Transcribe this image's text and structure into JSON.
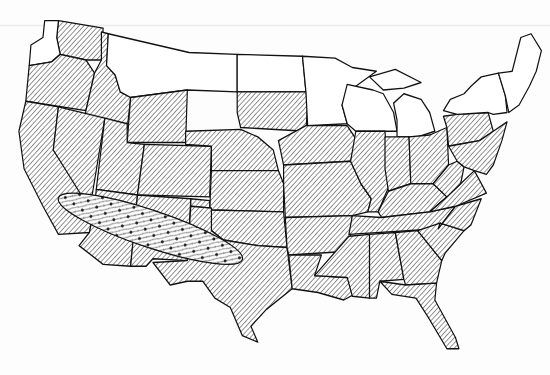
{
  "map": {
    "type": "choropleth-range-map",
    "region": "Contiguous United States",
    "colors": {
      "ink": "#111111",
      "paper": "#ffffff",
      "hatch": "#555555"
    },
    "legend": [],
    "patterns": {
      "hatched": "diagonal-hatch",
      "plain": "unshaded",
      "band": "stippled-dots-over-hatch"
    },
    "states": [
      {
        "id": "WA",
        "shade": "hatched",
        "d": "M68,22 L120,30 L118,64 L100,64 L70,58 L66,40 Z"
      },
      {
        "id": "WA-coast",
        "shade": "plain",
        "d": "M52,22 L68,22 L66,40 L70,58 L60,66 L34,70 L36,48 L50,40 Z"
      },
      {
        "id": "OR",
        "shade": "hatched",
        "d": "M34,70 L60,66 L70,58 L100,64 L110,78 L100,118 L30,108 Z"
      },
      {
        "id": "ID",
        "shade": "hatched",
        "d": "M118,34 L126,36 L124,70 L134,80 L140,98 L152,104 L148,138 L98,128 L100,118 L110,78 L118,64 Z"
      },
      {
        "id": "MT",
        "shade": "plain",
        "d": "M126,36 L220,56 L276,58 L276,98 L218,96 L152,104 L140,98 L134,80 L124,70 Z"
      },
      {
        "id": "ND",
        "shade": "plain",
        "d": "M276,58 L352,60 L356,98 L276,98 Z"
      },
      {
        "id": "SD",
        "shade": "hatched",
        "d": "M276,98 L356,98 L358,110 L356,140 L280,136 L276,120 Z"
      },
      {
        "id": "WY",
        "shade": "hatched",
        "d": "M152,104 L218,96 L216,152 L148,152 Z"
      },
      {
        "id": "CA",
        "shade": "hatched",
        "d": "M30,108 L68,114 L62,160 L110,222 L104,248 L68,250 L50,220 L28,180 L22,140 Z"
      },
      {
        "id": "NV",
        "shade": "hatched",
        "d": "M68,114 L122,126 L108,204 L104,222 L62,160 Z"
      },
      {
        "id": "UT",
        "shade": "hatched",
        "d": "M122,126 L148,132 L148,152 L168,154 L160,208 L112,202 Z"
      },
      {
        "id": "CO",
        "shade": "hatched",
        "d": "M168,154 L246,156 L244,210 L160,208 Z"
      },
      {
        "id": "AZ",
        "shade": "hatched",
        "d": "M112,202 L160,208 L152,284 L120,282 L92,262 L104,248 L110,222 Z"
      },
      {
        "id": "NM",
        "shade": "hatched",
        "d": "M160,208 L222,212 L218,278 L178,276 L170,284 L152,284 Z"
      },
      {
        "id": "NE",
        "shade": "hatched",
        "d": "M216,140 L280,138 L300,146 L318,160 L324,182 L246,182 L246,156 L216,154 Z"
      },
      {
        "id": "KS",
        "shade": "hatched",
        "d": "M246,182 L324,182 L330,196 L330,226 L244,224 Z"
      },
      {
        "id": "OK",
        "shade": "hatched",
        "d": "M222,212 L244,214 L244,224 L330,226 L334,264 L300,262 L260,256 L246,246 L246,222 L222,220 Z"
      },
      {
        "id": "TX",
        "shade": "hatched",
        "d": "M222,220 L246,222 L246,246 L260,256 L300,262 L334,264 L340,308 L310,330 L292,348 L300,365 L282,358 L268,328 L250,318 L236,300 L218,300 L198,304 L178,280 L218,278 Z"
      },
      {
        "id": "MN",
        "shade": "plain",
        "d": "M352,60 L390,62 L410,72 L438,76 L408,96 L398,112 L404,132 L358,134 L356,98 Z"
      },
      {
        "id": "IA",
        "shade": "hatched",
        "d": "M356,134 L404,134 L414,148 L408,172 L330,176 L324,150 Z"
      },
      {
        "id": "MO",
        "shade": "hatched",
        "d": "M330,176 L408,172 L420,196 L432,212 L428,226 L410,230 L332,232 L330,196 Z"
      },
      {
        "id": "AR",
        "shade": "hatched",
        "d": "M332,232 L410,230 L406,268 L336,272 L334,264 Z"
      },
      {
        "id": "LA",
        "shade": "hatched",
        "d": "M336,272 L374,272 L366,294 L404,296 L420,310 L400,320 L370,312 L340,308 Z"
      },
      {
        "id": "WI",
        "shade": "plain",
        "d": "M404,90 L434,96 L446,100 L458,120 L462,140 L414,140 L404,132 L398,112 Z"
      },
      {
        "id": "IL",
        "shade": "hatched",
        "d": "M414,140 L448,140 L452,200 L440,226 L428,226 L432,212 L420,196 L408,172 Z"
      },
      {
        "id": "MI",
        "shade": "plain",
        "d": "M458,110 L470,100 L490,106 L500,120 L506,140 L486,146 L462,146 L462,128 Z M430,82 L460,74 L490,88 L470,94 L446,96 Z"
      },
      {
        "id": "IN",
        "shade": "hatched",
        "d": "M448,146 L476,146 L478,196 L452,204 L448,180 Z"
      },
      {
        "id": "OH",
        "shade": "hatched",
        "d": "M476,146 L500,144 L520,136 L522,176 L504,196 L478,196 Z"
      },
      {
        "id": "KY",
        "shade": "hatched",
        "d": "M440,226 L452,204 L478,196 L504,196 L520,210 L500,226 L444,232 Z"
      },
      {
        "id": "TN",
        "shade": "hatched",
        "d": "M410,230 L444,232 L500,226 L530,220 L510,244 L406,250 Z"
      },
      {
        "id": "MS",
        "shade": "hatched",
        "d": "M406,252 L430,250 L430,318 L410,316 L404,296 L366,294 Z"
      },
      {
        "id": "AL",
        "shade": "hatched",
        "d": "M430,250 L460,248 L470,298 L442,300 L438,318 L430,318 Z"
      },
      {
        "id": "GA",
        "shade": "hatched",
        "d": "M460,248 L486,246 L514,278 L508,302 L472,304 L470,298 Z"
      },
      {
        "id": "FL",
        "shade": "hatched",
        "d": "M442,300 L472,304 L508,302 L506,320 L530,360 L534,372 L520,372 L498,338 L484,318 L456,314 Z"
      },
      {
        "id": "SC",
        "shade": "hatched",
        "d": "M486,246 L512,238 L540,246 L518,270 L514,278 Z"
      },
      {
        "id": "NC",
        "shade": "hatched",
        "d": "M510,244 L530,220 L560,212 L548,240 L540,246 L512,238 Z"
      },
      {
        "id": "VA",
        "shade": "hatched",
        "d": "M500,226 L520,210 L536,196 L552,182 L566,206 L530,220 Z"
      },
      {
        "id": "WV",
        "shade": "hatched",
        "d": "M504,196 L522,176 L532,172 L540,178 L536,196 L520,210 Z"
      },
      {
        "id": "PA",
        "shade": "hatched",
        "d": "M516,124 L532,122 L568,120 L574,140 L558,150 L522,156 L520,136 Z"
      },
      {
        "id": "NY",
        "shade": "plain",
        "d": "M516,118 L524,106 L540,100 L548,92 L560,82 L580,78 L588,102 L590,120 L574,122 L568,120 L532,122 Z"
      },
      {
        "id": "MD-DE-NJ",
        "shade": "hatched",
        "d": "M522,156 L558,150 L574,140 L590,130 L584,150 L574,176 L566,186 L552,182 L540,178 L532,172 Z"
      },
      {
        "id": "NE-states",
        "shade": "plain",
        "d": "M580,78 L596,76 L606,40 L618,36 L630,54 L624,76 L616,92 L604,112 L592,120 L588,102 Z"
      }
    ],
    "band": {
      "label": "",
      "cx": 175,
      "cy": 244,
      "rx": 112,
      "ry": 20,
      "rotate": 17
    }
  }
}
